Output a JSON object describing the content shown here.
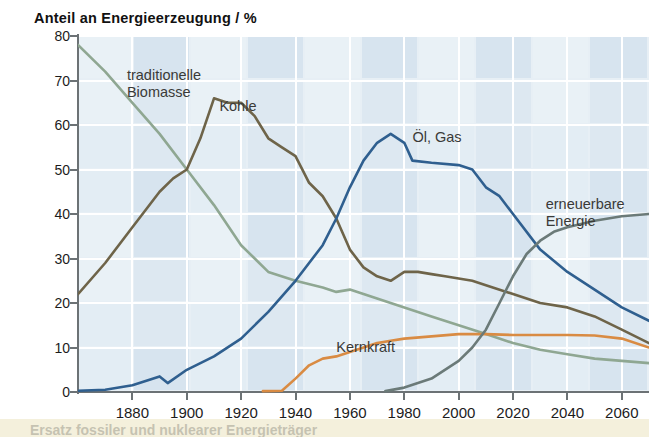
{
  "chart_data": {
    "type": "line",
    "title": "Anteil an Energieerzeugung / %",
    "xlabel": "",
    "ylabel": "Anteil an Energieerzeugung / %",
    "xlim": [
      1860,
      2070
    ],
    "ylim": [
      0,
      80
    ],
    "yticks": [
      0,
      10,
      20,
      30,
      40,
      50,
      60,
      70,
      80
    ],
    "xticks": [
      1880,
      1900,
      1920,
      1940,
      1960,
      1980,
      2000,
      2020,
      2040,
      2060
    ],
    "grid": true,
    "legend_position": "inline-annotations",
    "series": [
      {
        "name": "traditionelle Biomasse",
        "color": "#8fa792",
        "label_x": 1878,
        "label_y": 71,
        "points": [
          [
            1860,
            78
          ],
          [
            1870,
            72
          ],
          [
            1880,
            65
          ],
          [
            1890,
            58
          ],
          [
            1900,
            50
          ],
          [
            1910,
            42
          ],
          [
            1920,
            33
          ],
          [
            1925,
            30
          ],
          [
            1930,
            27
          ],
          [
            1940,
            25
          ],
          [
            1950,
            23.5
          ],
          [
            1955,
            22.5
          ],
          [
            1960,
            23
          ],
          [
            1965,
            22
          ],
          [
            1970,
            21
          ],
          [
            1980,
            19
          ],
          [
            1990,
            17
          ],
          [
            2000,
            15
          ],
          [
            2010,
            13
          ],
          [
            2020,
            11
          ],
          [
            2030,
            9.5
          ],
          [
            2040,
            8.5
          ],
          [
            2050,
            7.5
          ],
          [
            2060,
            7
          ],
          [
            2070,
            6.5
          ]
        ]
      },
      {
        "name": "Kohle",
        "color": "#6e6449",
        "label_x": 1912,
        "label_y": 64,
        "points": [
          [
            1860,
            22
          ],
          [
            1870,
            29
          ],
          [
            1880,
            37
          ],
          [
            1890,
            45
          ],
          [
            1895,
            48
          ],
          [
            1900,
            50
          ],
          [
            1905,
            57
          ],
          [
            1910,
            66
          ],
          [
            1915,
            65
          ],
          [
            1920,
            65
          ],
          [
            1925,
            62
          ],
          [
            1930,
            57
          ],
          [
            1935,
            55
          ],
          [
            1940,
            53
          ],
          [
            1945,
            47
          ],
          [
            1950,
            44
          ],
          [
            1955,
            39
          ],
          [
            1960,
            32
          ],
          [
            1965,
            28
          ],
          [
            1970,
            26
          ],
          [
            1975,
            25
          ],
          [
            1980,
            27
          ],
          [
            1985,
            27
          ],
          [
            1990,
            26.5
          ],
          [
            1995,
            26
          ],
          [
            2000,
            25.5
          ],
          [
            2005,
            25
          ],
          [
            2010,
            24
          ],
          [
            2020,
            22
          ],
          [
            2030,
            20
          ],
          [
            2040,
            19
          ],
          [
            2050,
            17
          ],
          [
            2060,
            14
          ],
          [
            2070,
            11
          ]
        ]
      },
      {
        "name": "Öl, Gas",
        "color": "#2f5f8f",
        "label_x": 1983,
        "label_y": 57,
        "points": [
          [
            1860,
            0.3
          ],
          [
            1870,
            0.5
          ],
          [
            1880,
            1.5
          ],
          [
            1890,
            3.5
          ],
          [
            1893,
            2
          ],
          [
            1900,
            5
          ],
          [
            1910,
            8
          ],
          [
            1920,
            12
          ],
          [
            1930,
            18
          ],
          [
            1940,
            25
          ],
          [
            1950,
            33
          ],
          [
            1955,
            39
          ],
          [
            1960,
            46
          ],
          [
            1965,
            52
          ],
          [
            1970,
            56
          ],
          [
            1975,
            58
          ],
          [
            1980,
            56
          ],
          [
            1983,
            52
          ],
          [
            1990,
            51.5
          ],
          [
            2000,
            51
          ],
          [
            2005,
            50
          ],
          [
            2010,
            46
          ],
          [
            2015,
            44
          ],
          [
            2020,
            40
          ],
          [
            2030,
            32
          ],
          [
            2040,
            27
          ],
          [
            2050,
            23
          ],
          [
            2060,
            19
          ],
          [
            2070,
            16
          ]
        ]
      },
      {
        "name": "Kernkraft",
        "color": "#d98b43",
        "label_x": 1955,
        "label_y": 10,
        "points": [
          [
            1928,
            0.2
          ],
          [
            1935,
            0.3
          ],
          [
            1940,
            3
          ],
          [
            1945,
            6
          ],
          [
            1950,
            7.5
          ],
          [
            1955,
            8
          ],
          [
            1960,
            9
          ],
          [
            1965,
            10
          ],
          [
            1970,
            11
          ],
          [
            1975,
            11.5
          ],
          [
            1980,
            12
          ],
          [
            1990,
            12.5
          ],
          [
            2000,
            13
          ],
          [
            2010,
            13
          ],
          [
            2020,
            12.8
          ],
          [
            2030,
            12.8
          ],
          [
            2040,
            12.8
          ],
          [
            2050,
            12.7
          ],
          [
            2060,
            12
          ],
          [
            2070,
            10
          ]
        ]
      },
      {
        "name": "erneuerbare Energie",
        "color": "#6b7a78",
        "label_x": 2032,
        "label_y": 42,
        "points": [
          [
            1973,
            0.2
          ],
          [
            1980,
            1
          ],
          [
            1990,
            3
          ],
          [
            2000,
            7
          ],
          [
            2005,
            10
          ],
          [
            2010,
            14
          ],
          [
            2015,
            20
          ],
          [
            2020,
            26
          ],
          [
            2025,
            31
          ],
          [
            2030,
            34
          ],
          [
            2035,
            36
          ],
          [
            2040,
            37
          ],
          [
            2050,
            38.5
          ],
          [
            2060,
            39.5
          ],
          [
            2070,
            40
          ]
        ]
      }
    ]
  },
  "caption": {
    "text": "Ersatz fossiler und nuklearer Energieträger"
  }
}
